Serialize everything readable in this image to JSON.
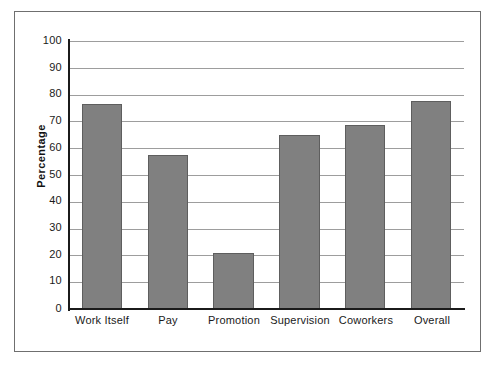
{
  "chart_data": {
    "type": "bar",
    "title": "",
    "subtitle": "",
    "xlabel": "",
    "ylabel": "Percentage",
    "categories": [
      "Work Itself",
      "Pay",
      "Promotion",
      "Supervision",
      "Coworkers",
      "Overall"
    ],
    "values": [
      76.5,
      57.5,
      21,
      65,
      68.5,
      77.5
    ],
    "ylim": [
      0,
      100
    ],
    "yticks": [
      0,
      10,
      20,
      30,
      40,
      50,
      60,
      70,
      80,
      90,
      100
    ],
    "ytick_labels": [
      "0",
      "10",
      "20",
      "30",
      "40",
      "50",
      "60",
      "70",
      "80",
      "90",
      "100"
    ],
    "grid": true,
    "grid_axis": "y",
    "legend": false,
    "legend_position": "none",
    "bar_color": "#808080",
    "bar_edge_color": "#5e5e5e",
    "gridline_color": "#9d9d9d",
    "axis_color": "#1b1b1b",
    "frame_color": "#6f6f6f",
    "background_color": "#ffffff",
    "annotations": []
  }
}
